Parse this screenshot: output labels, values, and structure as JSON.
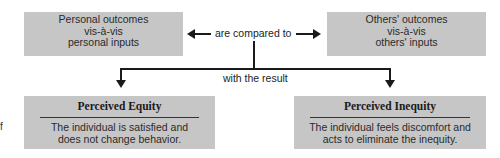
{
  "diagram": {
    "left_input": [
      "Personal outcomes",
      "vis-à-vis",
      "personal inputs"
    ],
    "right_input": [
      "Others' outcomes",
      "vis-à-vis",
      "others' inputs"
    ],
    "comparison_label": "are compared to",
    "result_label": "with the result",
    "outcomes": [
      {
        "title": "Perceived Equity",
        "body": [
          "The individual is satisfied and",
          "does not change behavior."
        ]
      },
      {
        "title": "Perceived Inequity",
        "body": [
          "The individual feels discomfort and",
          "acts to eliminate the inequity."
        ]
      }
    ],
    "margin_fragment": "f"
  }
}
